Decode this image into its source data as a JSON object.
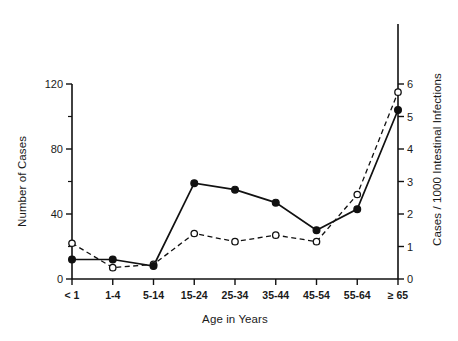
{
  "chart_data": {
    "type": "line",
    "title": "",
    "xlabel": "Age in Years",
    "ylabel": "Number of Cases",
    "ylabel_right": "Cases / 1000 Intestinal Infections",
    "categories": [
      "< 1",
      "1-4",
      "5-14",
      "15-24",
      "25-34",
      "35-44",
      "45-54",
      "55-64",
      "≥ 65"
    ],
    "ylim": [
      0,
      120
    ],
    "yticks": [
      0,
      40,
      80,
      120
    ],
    "yticks_minor": [
      20,
      60,
      100
    ],
    "ytick_labels": [
      "0",
      "40",
      "80",
      "120"
    ],
    "ylim_right": [
      0,
      6
    ],
    "yticks_right": [
      0,
      1,
      2,
      3,
      4,
      5,
      6
    ],
    "ytick_labels_right": [
      "0",
      "1",
      "2",
      "3",
      "4",
      "5",
      "6"
    ],
    "grid": false,
    "legend": "none",
    "series": [
      {
        "name": "Number of Cases",
        "axis": "left",
        "marker": "filled-circle",
        "line_style": "solid",
        "color": "#111111",
        "values": [
          12,
          12,
          8,
          59,
          55,
          47,
          30,
          43,
          104
        ]
      },
      {
        "name": "Cases / 1000 Intestinal Infections",
        "axis": "right",
        "marker": "open-circle",
        "line_style": "dashed",
        "color": "#111111",
        "values": [
          1.1,
          0.35,
          0.45,
          1.4,
          1.15,
          1.35,
          1.15,
          2.6,
          5.75
        ]
      }
    ]
  }
}
